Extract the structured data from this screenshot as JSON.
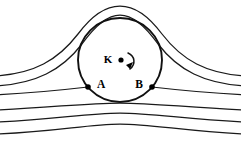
{
  "figure": {
    "type": "diagram",
    "background_color": "#ffffff",
    "line_color": "#1a1a1a",
    "width": 241,
    "height": 142
  },
  "labels": {
    "center": "K",
    "stagnation_left": "A",
    "stagnation_right": "B"
  },
  "cylinder": {
    "name": "rotating-cylinder",
    "center_x": 120,
    "center_y": 60,
    "radius": 42,
    "center_marker": "filled-dot",
    "rotation_direction": "clockwise",
    "rotation_indicator": "curved-arrow"
  },
  "stagnation_points": [
    {
      "label": "A",
      "x": 88,
      "y": 87,
      "marker": "filled-dot",
      "label_side": "right"
    },
    {
      "label": "B",
      "x": 152,
      "y": 87,
      "marker": "filled-dot",
      "label_side": "left"
    }
  ],
  "streamlines": {
    "count": 6,
    "above_cylinder": 2,
    "attached_to_cylinder": 1,
    "below_cylinder": 3,
    "description": "Streamlines deflect upward over the cylinder; the dividing streamline meets the body at stagnation points A and B"
  },
  "chart_data": {
    "type": "line",
    "xlabel": "",
    "ylabel": "",
    "grid": false,
    "legend": "none",
    "xlim": [
      0,
      241
    ],
    "ylim": [
      0,
      142
    ],
    "series": [
      {
        "name": "streamline-1-over-top",
        "path": "M -6 76 C 34 74, 58 60, 78 34 C 92 15, 106 6, 120 6 C 134 6, 148 15, 162 34 C 182 60, 206 74, 247 76"
      },
      {
        "name": "streamline-2-over-top",
        "path": "M -6 86 C 36 84, 62 70, 82 44 C 94 27, 107 15, 120 15 C 133 15, 146 27, 158 44 C 178 70, 204 84, 247 86"
      },
      {
        "name": "streamline-3-dividing-through-A-B",
        "path": "M -6 95 C 34 93, 62 90, 88 87"
      },
      {
        "name": "streamline-3b-dividing-right",
        "path": "M 152 87 C 178 90, 206 93, 247 95"
      },
      {
        "name": "streamline-4-below",
        "path": "M -6 110 C 50 108, 84 103, 120 103 C 156 103, 190 108, 247 110"
      },
      {
        "name": "streamline-5-below",
        "path": "M -6 122 C 52 120, 86 113, 120 113 C 154 113, 190 120, 247 122"
      },
      {
        "name": "streamline-6-below",
        "path": "M -6 134 C 54 132, 88 124, 120 124 C 152 124, 190 132, 247 134"
      }
    ],
    "annotations": [
      {
        "text": "K",
        "x": 111,
        "y": 60,
        "role": "cylinder-center-label"
      },
      {
        "text": "A",
        "x": 96,
        "y": 85,
        "role": "stagnation-point-label"
      },
      {
        "text": "B",
        "x": 144,
        "y": 85,
        "role": "stagnation-point-label"
      }
    ]
  }
}
